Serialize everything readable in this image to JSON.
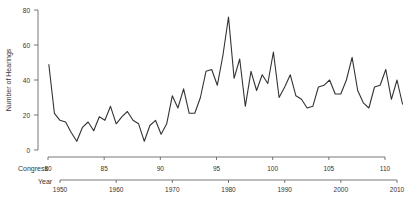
{
  "chart_data": {
    "type": "line",
    "title": "",
    "ylabel": "Number of Hearings",
    "xlabel": "",
    "ylim": [
      0,
      80
    ],
    "yticks": [
      0,
      20,
      40,
      60,
      80
    ],
    "grid": false,
    "legend": null,
    "x_axes": [
      {
        "label": "Congress",
        "ticks": [
          80,
          85,
          90,
          95,
          100,
          105,
          110
        ],
        "range": [
          80,
          110
        ]
      },
      {
        "label": "Year",
        "ticks": [
          1950,
          1960,
          1970,
          1980,
          1990,
          2000,
          2010
        ],
        "range": [
          1950,
          2010
        ]
      }
    ],
    "x": [
      1948,
      1949,
      1950,
      1951,
      1952,
      1953,
      1954,
      1955,
      1956,
      1957,
      1958,
      1959,
      1960,
      1961,
      1962,
      1963,
      1964,
      1965,
      1966,
      1967,
      1968,
      1969,
      1970,
      1971,
      1972,
      1973,
      1974,
      1975,
      1976,
      1977,
      1978,
      1979,
      1980,
      1981,
      1982,
      1983,
      1984,
      1985,
      1986,
      1987,
      1988,
      1989,
      1990,
      1991,
      1992,
      1993,
      1994,
      1995,
      1996,
      1997,
      1998,
      1999,
      2000,
      2001,
      2002,
      2003,
      2004,
      2005,
      2006,
      2007,
      2008,
      2009,
      2010,
      2011
    ],
    "series": [
      {
        "name": "Number of Hearings",
        "values": [
          49,
          21,
          17,
          16,
          10,
          5,
          13,
          16,
          11,
          19,
          17,
          25,
          15,
          19,
          22,
          17,
          15,
          5,
          14,
          17,
          9,
          15,
          31,
          24,
          35,
          21,
          21,
          30,
          45,
          46,
          37,
          54,
          76,
          41,
          52,
          25,
          45,
          34,
          43,
          38,
          56,
          30,
          36,
          43,
          31,
          29,
          24,
          25,
          36,
          37,
          40,
          32,
          32,
          40,
          53,
          34,
          27,
          24,
          36,
          37,
          46,
          29,
          40,
          26
        ]
      }
    ]
  },
  "axis_labels": {
    "y": "Number of Hearings",
    "congress": "Congress",
    "year": "Year"
  },
  "style": {
    "line_color": "#333333",
    "axis_color": "#555555"
  }
}
